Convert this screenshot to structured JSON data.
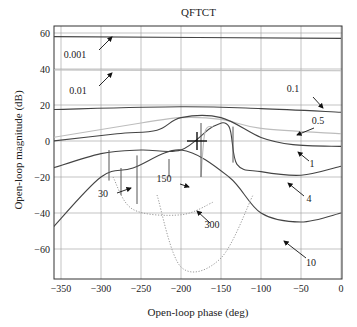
{
  "chart_data": {
    "type": "line",
    "title": "QFTCT",
    "xlabel": "Open-loop phase (deg)",
    "ylabel": "Open-loop magnitude (dB)",
    "xlim": [
      -360,
      0
    ],
    "ylim": [
      -78,
      62
    ],
    "xticks": [
      -350,
      -300,
      -250,
      -200,
      -150,
      -100,
      -50,
      0
    ],
    "yticks": [
      60,
      40,
      20,
      0,
      -20,
      -40,
      -60
    ],
    "grid": true,
    "series": [
      {
        "name": "0.001",
        "style": "solid",
        "points": [
          [
            -360,
            58
          ],
          [
            0,
            57
          ]
        ]
      },
      {
        "name": "0.01",
        "style": "solid-light",
        "points": [
          [
            -360,
            39.5
          ],
          [
            0,
            39
          ]
        ]
      },
      {
        "name": "0.1",
        "style": "solid",
        "points": [
          [
            -360,
            17.5
          ],
          [
            -200,
            19
          ],
          [
            -100,
            18
          ],
          [
            0,
            16
          ]
        ]
      },
      {
        "name": "0.5",
        "style": "solid-light",
        "points": [
          [
            -360,
            2
          ],
          [
            -250,
            10
          ],
          [
            -200,
            13
          ],
          [
            -150,
            12
          ],
          [
            -100,
            7
          ],
          [
            0,
            4
          ]
        ]
      },
      {
        "name": "1",
        "style": "solid",
        "points": [
          [
            -360,
            0
          ],
          [
            -280,
            4
          ],
          [
            -230,
            6
          ],
          [
            -200,
            13
          ],
          [
            -150,
            13
          ],
          [
            -100,
            2
          ],
          [
            -60,
            -2
          ],
          [
            0,
            -3
          ]
        ]
      },
      {
        "name": "4",
        "style": "solid",
        "points": [
          [
            -360,
            -15
          ],
          [
            -300,
            -7
          ],
          [
            -250,
            -5
          ],
          [
            -200,
            -5
          ],
          [
            -160,
            8
          ],
          [
            -140,
            8
          ],
          [
            -130,
            -13
          ],
          [
            -100,
            -17
          ],
          [
            -50,
            -19
          ],
          [
            0,
            -14
          ]
        ]
      },
      {
        "name": "10",
        "style": "solid",
        "points": [
          [
            -360,
            -48
          ],
          [
            -300,
            -20
          ],
          [
            -260,
            -15
          ],
          [
            -200,
            -5
          ],
          [
            -140,
            -20
          ],
          [
            -100,
            -40
          ],
          [
            -50,
            -45
          ],
          [
            0,
            -40
          ]
        ]
      },
      {
        "name": "30",
        "style": "dotted",
        "points": [
          [
            -285,
            -20
          ],
          [
            -260,
            -38
          ],
          [
            -200,
            -41
          ],
          [
            -160,
            -34
          ]
        ]
      },
      {
        "name": "150",
        "style": "solid-light",
        "points": [
          [
            -175,
            -20
          ],
          [
            -170,
            5
          ],
          [
            -160,
            8
          ]
        ]
      },
      {
        "name": "300",
        "style": "dotted",
        "points": [
          [
            -230,
            -30
          ],
          [
            -200,
            -70
          ],
          [
            -150,
            -65
          ],
          [
            -110,
            -30
          ]
        ]
      }
    ],
    "annotations": [
      "0.001",
      "0.01",
      "0.1",
      "0.5",
      "1",
      "4",
      "10",
      "30",
      "150",
      "300"
    ]
  }
}
